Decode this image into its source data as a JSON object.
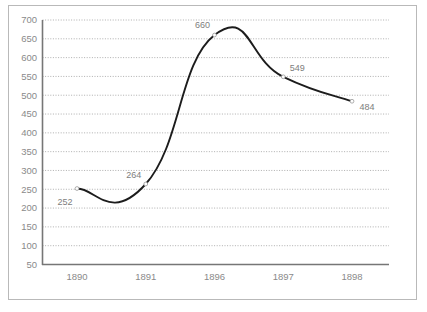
{
  "chart_data": {
    "type": "line",
    "title": "",
    "subtitle": "",
    "xlabel": "",
    "ylabel": "",
    "categories": [
      "1890",
      "1891",
      "1896",
      "1897",
      "1898"
    ],
    "values": [
      252,
      264,
      660,
      549,
      484
    ],
    "series": [
      {
        "name": "",
        "values": [
          252,
          264,
          660,
          549,
          484
        ]
      }
    ],
    "point_labels": [
      "252",
      "264",
      "660",
      "549",
      "484"
    ],
    "ylim": [
      50,
      700
    ],
    "ytick_labels": [
      "700",
      "650",
      "600",
      "550",
      "500",
      "450",
      "400",
      "350",
      "300",
      "250",
      "200",
      "150",
      "100",
      "50"
    ],
    "ytick_values": [
      700,
      650,
      600,
      550,
      500,
      450,
      400,
      350,
      300,
      250,
      200,
      150,
      100,
      50
    ],
    "xtick_labels": [
      "1890",
      "1891",
      "1896",
      "1897",
      "1898"
    ],
    "grid": true,
    "grid_orientation": "horizontal",
    "grid_style": "dotted",
    "legend": false,
    "legend_position": "none",
    "markers": "open-circle",
    "line_style": "smooth",
    "colors": {
      "line": "#1c1c1c",
      "grid": "#9a9a9a",
      "axis": "#767676",
      "tick_label": "#8a8a8a",
      "point_label": "#7d7d7d",
      "border": "#b9b9b9",
      "background": "#ffffff"
    }
  }
}
